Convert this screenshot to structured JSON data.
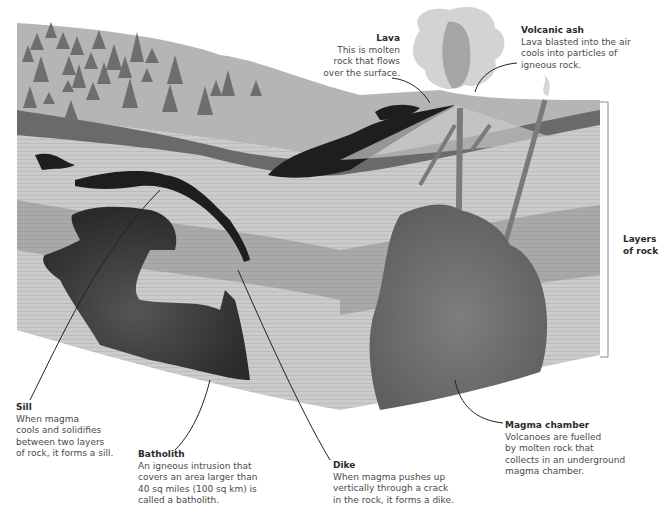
{
  "diagram": {
    "colors": {
      "background": "#ffffff",
      "ground_surface": "#b4b4b4",
      "trees": "#6e6e6e",
      "dark_band": "#6a6a6a",
      "light_rock": "#c8c8c8",
      "mid_rock": "#a4a4a4",
      "magma_dark": "#222222",
      "magma_chamber": "#6c6c6c",
      "ash_cloud": "#cfcfcf",
      "text": "#4a4a4a"
    }
  },
  "labels": {
    "lava": {
      "title": "Lava",
      "body": "This is molten\nrock that flows\nover the surface."
    },
    "volcanic_ash": {
      "title": "Volcanic ash",
      "body": "Lava blasted into the air\ncools into particles of\nigneous rock."
    },
    "layers_of_rock": {
      "title": "Layers\nof rock"
    },
    "sill": {
      "title": "Sill",
      "body": "When magma\ncools and solidifies\nbetween two layers\nof rock, it forms a sill."
    },
    "batholith": {
      "title": "Batholith",
      "body": "An igneous intrusion that\ncovers an area larger than\n40 sq miles (100 sq km) is\ncalled a batholith."
    },
    "dike": {
      "title": "Dike",
      "body": "When magma pushes up\nvertically through a crack\nin the rock, it forms a dike."
    },
    "magma_chamber": {
      "title": "Magma chamber",
      "body": "Volcanoes are fuelled\nby molten rock that\ncollects in an underground\nmagma chamber."
    }
  }
}
